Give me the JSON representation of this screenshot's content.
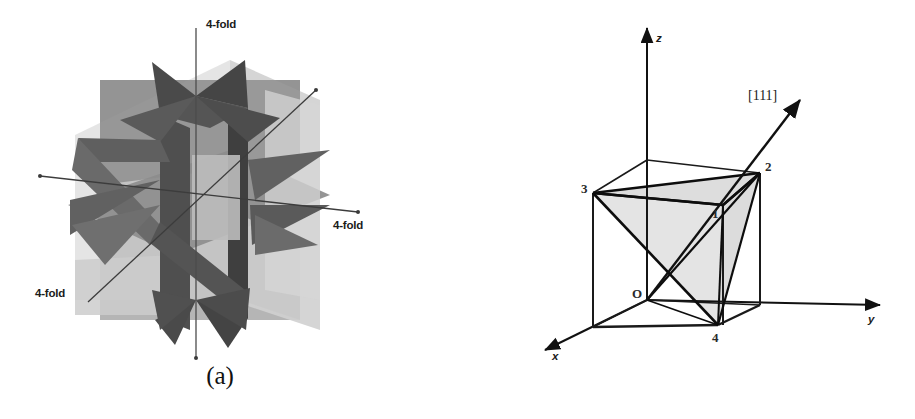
{
  "figure": {
    "background_color": "#ffffff",
    "panels": [
      {
        "id": "a",
        "caption": "(a)",
        "description": "Symmetry planes of a cubic crystal with three 4-fold rotation axes",
        "axis_labels": [
          {
            "text": "4-fold",
            "position": "top"
          },
          {
            "text": "4-fold",
            "position": "right"
          },
          {
            "text": "4-fold",
            "position": "bottom-left"
          }
        ],
        "colors": {
          "plane_light": "#d3d3d3",
          "plane_mid": "#9e9e9e",
          "plane_dark": "#777777",
          "plane_darkest": "#4a4a4a",
          "axis_line": "#2b2b2b"
        }
      },
      {
        "id": "b",
        "caption": "(b)",
        "description": "Cube with inscribed tetrahedron and [111] direction vector",
        "axes": [
          {
            "name": "z",
            "label": "z"
          },
          {
            "name": "y",
            "label": "y"
          },
          {
            "name": "x",
            "label": "x"
          }
        ],
        "origin_label": "O",
        "direction_label": "[111]",
        "vertex_labels": [
          {
            "id": "v1",
            "label": "1"
          },
          {
            "id": "v2",
            "label": "2"
          },
          {
            "id": "v3",
            "label": "3"
          },
          {
            "id": "v4",
            "label": "4"
          }
        ],
        "colors": {
          "cube_edge": "#1a1a1a",
          "tetra_fill": "#e2e2e2",
          "axis_line": "#111111"
        }
      }
    ]
  }
}
